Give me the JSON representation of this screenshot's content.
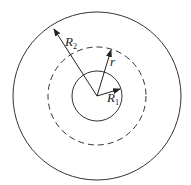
{
  "diagram": {
    "center": {
      "x": 97,
      "y": 96
    },
    "circles": [
      {
        "name": "outer",
        "radius": 84,
        "style": "solid"
      },
      {
        "name": "gaussian-surface",
        "radius": 49,
        "style": "dashed"
      },
      {
        "name": "inner",
        "radius": 25,
        "style": "solid"
      }
    ],
    "labels": {
      "R2": {
        "base": "R",
        "sub": "2"
      },
      "r": {
        "base": "r"
      },
      "R1": {
        "base": "R",
        "sub": "1"
      }
    },
    "stroke_color": "#333333"
  }
}
